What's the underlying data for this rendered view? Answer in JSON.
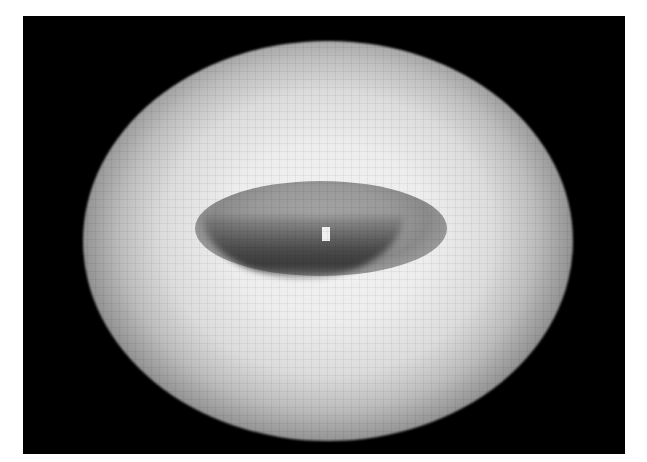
{
  "image": {
    "description": "Pixelated grayscale image of a bright diffuse elliptical glow with a darker inner elliptical ring and a small bright central spot, on a black background with white margins",
    "background_color": "#000000",
    "margin_color": "#ffffff",
    "glow_color": "#ededed",
    "inner_ring_color": "#4a4a4a",
    "central_spot_color": "#f0f0f0"
  }
}
